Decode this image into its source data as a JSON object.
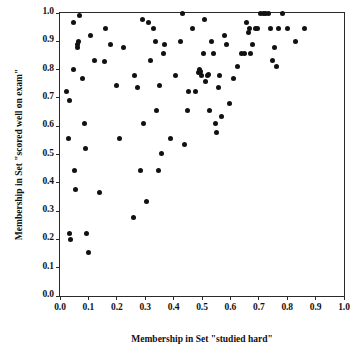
{
  "chart_data": {
    "type": "scatter",
    "title": "",
    "xlabel": "Membership in Set \"studied hard\"",
    "ylabel": "Membership in Set \"scored well on exam\"",
    "xlim": [
      0.0,
      1.0
    ],
    "ylim": [
      0.0,
      1.0
    ],
    "xticks": [
      "0.0",
      "0.1",
      "0.2",
      "0.3",
      "0.4",
      "0.5",
      "0.6",
      "0.7",
      "0.8",
      "0.9",
      "1.0"
    ],
    "yticks": [
      "0.0",
      "0.1",
      "0.2",
      "0.3",
      "0.4",
      "0.5",
      "0.6",
      "0.7",
      "0.8",
      "0.9",
      "1.0"
    ],
    "xtick_values": [
      0.0,
      0.1,
      0.2,
      0.3,
      0.4,
      0.5,
      0.6,
      0.7,
      0.8,
      0.9,
      1.0
    ],
    "ytick_values": [
      0.0,
      0.1,
      0.2,
      0.3,
      0.4,
      0.5,
      0.6,
      0.7,
      0.8,
      0.9,
      1.0
    ],
    "grid": false,
    "legend": null,
    "marker": {
      "shape": "circle",
      "filled": true,
      "color": "#111111",
      "size_px": 5
    },
    "frame_color": "#2a2a2a",
    "background_color": "#ffffff",
    "n_points": 97,
    "series": [
      {
        "name": "cases",
        "points": [
          [
            0.024,
            0.722
          ],
          [
            0.03,
            0.555
          ],
          [
            0.033,
            0.69
          ],
          [
            0.035,
            0.222
          ],
          [
            0.036,
            0.201
          ],
          [
            0.046,
            0.8
          ],
          [
            0.049,
            0.965
          ],
          [
            0.052,
            0.445
          ],
          [
            0.055,
            0.378
          ],
          [
            0.062,
            0.878
          ],
          [
            0.065,
            0.9
          ],
          [
            0.067,
            0.99
          ],
          [
            0.078,
            0.767
          ],
          [
            0.086,
            0.611
          ],
          [
            0.09,
            0.522
          ],
          [
            0.094,
            0.222
          ],
          [
            0.1,
            0.152
          ],
          [
            0.108,
            0.922
          ],
          [
            0.12,
            0.833
          ],
          [
            0.14,
            0.367
          ],
          [
            0.16,
            0.945
          ],
          [
            0.178,
            0.889
          ],
          [
            0.2,
            0.745
          ],
          [
            0.208,
            0.555
          ],
          [
            0.225,
            0.878
          ],
          [
            0.258,
            0.278
          ],
          [
            0.262,
            0.778
          ],
          [
            0.272,
            0.735
          ],
          [
            0.285,
            0.445
          ],
          [
            0.29,
            0.978
          ],
          [
            0.295,
            0.611
          ],
          [
            0.305,
            0.333
          ],
          [
            0.31,
            0.967
          ],
          [
            0.318,
            0.833
          ],
          [
            0.33,
            0.945
          ],
          [
            0.335,
            0.9
          ],
          [
            0.34,
            0.657
          ],
          [
            0.348,
            0.445
          ],
          [
            0.352,
            0.745
          ],
          [
            0.358,
            0.502
          ],
          [
            0.365,
            0.856
          ],
          [
            0.368,
            0.889
          ],
          [
            0.39,
            0.555
          ],
          [
            0.405,
            0.778
          ],
          [
            0.425,
            0.9
          ],
          [
            0.432,
            1.0
          ],
          [
            0.438,
            0.534
          ],
          [
            0.448,
            0.657
          ],
          [
            0.452,
            0.722
          ],
          [
            0.468,
            0.945
          ],
          [
            0.478,
            0.722
          ],
          [
            0.486,
            0.79
          ],
          [
            0.492,
            0.8
          ],
          [
            0.498,
            0.779
          ],
          [
            0.505,
            0.856
          ],
          [
            0.508,
            0.978
          ],
          [
            0.512,
            0.757
          ],
          [
            0.522,
            0.782
          ],
          [
            0.528,
            0.657
          ],
          [
            0.535,
            0.9
          ],
          [
            0.542,
            0.856
          ],
          [
            0.548,
            0.611
          ],
          [
            0.552,
            0.578
          ],
          [
            0.558,
            0.735
          ],
          [
            0.562,
            0.78
          ],
          [
            0.568,
            0.635
          ],
          [
            0.578,
            0.922
          ],
          [
            0.588,
            0.889
          ],
          [
            0.598,
            0.68
          ],
          [
            0.612,
            0.77
          ],
          [
            0.625,
            0.812
          ],
          [
            0.638,
            0.856
          ],
          [
            0.648,
            0.856
          ],
          [
            0.655,
            0.968
          ],
          [
            0.662,
            0.93
          ],
          [
            0.668,
            0.945
          ],
          [
            0.672,
            0.856
          ],
          [
            0.678,
            0.889
          ],
          [
            0.688,
            0.945
          ],
          [
            0.695,
            0.945
          ],
          [
            0.705,
            1.0
          ],
          [
            0.718,
            1.0
          ],
          [
            0.722,
            1.0
          ],
          [
            0.735,
            1.0
          ],
          [
            0.742,
            0.945
          ],
          [
            0.748,
            0.833
          ],
          [
            0.755,
            0.878
          ],
          [
            0.762,
            0.812
          ],
          [
            0.768,
            0.945
          ],
          [
            0.785,
            1.0
          ],
          [
            0.8,
            0.945
          ],
          [
            0.83,
            0.9
          ],
          [
            0.86,
            0.945
          ],
          [
            0.06,
            0.89
          ],
          [
            0.155,
            0.828
          ],
          [
            0.52,
            0.78
          ],
          [
            0.495,
            0.795
          ]
        ]
      }
    ]
  }
}
